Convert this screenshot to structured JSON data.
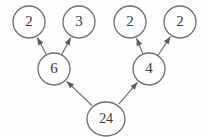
{
  "diagram": {
    "type": "factor-tree",
    "background_color": "#fdfdfd",
    "stroke_color": "#6e6e6e",
    "text_color": "#3a3a3a",
    "nodes": [
      {
        "id": "n2a",
        "label": "2",
        "cx": 29,
        "cy": 22,
        "r": 16,
        "rx": 16,
        "ry": 16,
        "level": "leaf"
      },
      {
        "id": "n3",
        "label": "3",
        "cx": 79,
        "cy": 22,
        "r": 16,
        "rx": 16,
        "ry": 16,
        "level": "leaf"
      },
      {
        "id": "n2b",
        "label": "2",
        "cx": 130,
        "cy": 22,
        "r": 16,
        "rx": 16,
        "ry": 16,
        "level": "leaf"
      },
      {
        "id": "n2c",
        "label": "2",
        "cx": 180,
        "cy": 22,
        "r": 16,
        "rx": 16,
        "ry": 16,
        "level": "leaf"
      },
      {
        "id": "n6",
        "label": "6",
        "cx": 54,
        "cy": 69,
        "r": 16,
        "rx": 16,
        "ry": 16,
        "level": "branch"
      },
      {
        "id": "n4",
        "label": "4",
        "cx": 149,
        "cy": 69,
        "r": 16,
        "rx": 16,
        "ry": 16,
        "level": "branch"
      },
      {
        "id": "n24",
        "label": "24",
        "cx": 106,
        "cy": 119,
        "r": 18,
        "rx": 19,
        "ry": 17,
        "level": "root"
      }
    ],
    "edges": [
      {
        "id": "e1",
        "from": "n6",
        "to": "n2a",
        "arrow": true
      },
      {
        "id": "e2",
        "from": "n6",
        "to": "n3",
        "arrow": true
      },
      {
        "id": "e3",
        "from": "n4",
        "to": "n2b",
        "arrow": true
      },
      {
        "id": "e4",
        "from": "n4",
        "to": "n2c",
        "arrow": true
      },
      {
        "id": "e5",
        "from": "n24",
        "to": "n6",
        "arrow": true
      },
      {
        "id": "e6",
        "from": "n24",
        "to": "n4",
        "arrow": true
      }
    ]
  }
}
